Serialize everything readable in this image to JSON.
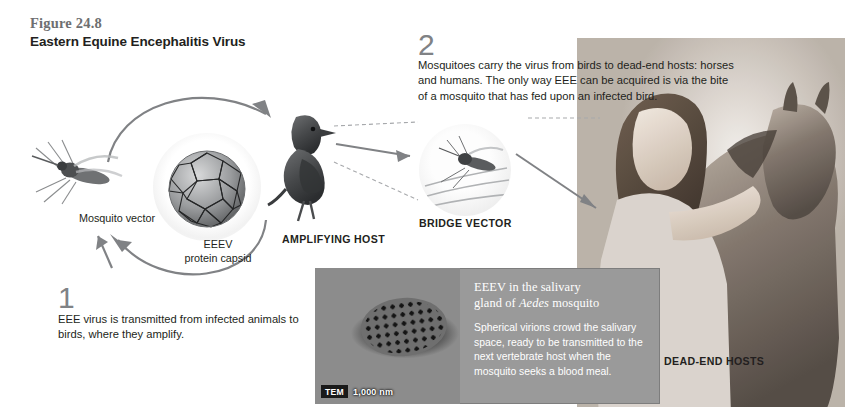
{
  "figure": {
    "number": "Figure 24.8",
    "title": "Eastern Equine Encephalitis Virus"
  },
  "steps": [
    {
      "num": "1",
      "text": "EEE virus is transmitted from infected animals to birds, where they amplify."
    },
    {
      "num": "2",
      "text": "Mosquitoes carry the virus from birds to dead-end hosts: horses and humans. The only way EEE can be acquired is via the bite of a mosquito that has fed upon an infected bird."
    }
  ],
  "labels": {
    "mosquito_vector": "Mosquito vector",
    "capsid": "EEEV\nprotein capsid",
    "capsid_line1": "EEEV",
    "capsid_line2": "protein capsid",
    "amplifying_host": "AMPLIFYING HOST",
    "bridge_vector": "BRIDGE VECTOR",
    "dead_end_hosts": "DEAD-END HOSTS"
  },
  "inset": {
    "heading_part1": "EEEV in the salivary gland of ",
    "heading_italic": "Aedes",
    "heading_part2": " mosquito",
    "heading_line1": "EEEV in the salivary",
    "heading_line2_pre": "gland of ",
    "heading_line2_italic": "Aedes",
    "heading_line2_post": " mosquito",
    "body": "Spherical virions crowd the salivary space, ready to be transmitted to the next vertebrate host when the mosquito seeks a blood meal.",
    "micrograph_technique": "TEM",
    "micrograph_scale": "1,000 nm"
  },
  "colors": {
    "arrow_gray": "#808285",
    "dashed_gray": "#a7a9ac",
    "fig_number_gray": "#6e6f71",
    "text_black": "#231f20",
    "inset_panel_gray": "#9a9a9a",
    "inset_text_white": "#ffffff"
  },
  "artwork": {
    "mosquito_vector_image": "mosquito-photo",
    "capsid_image": "virus-capsid-model",
    "bird_image": "bird-photo",
    "bridge_vector_image": "mosquito-closeup-photo",
    "dead_end_hosts_image": "woman-and-horse-photo",
    "micrograph_image": "tem-micrograph"
  }
}
